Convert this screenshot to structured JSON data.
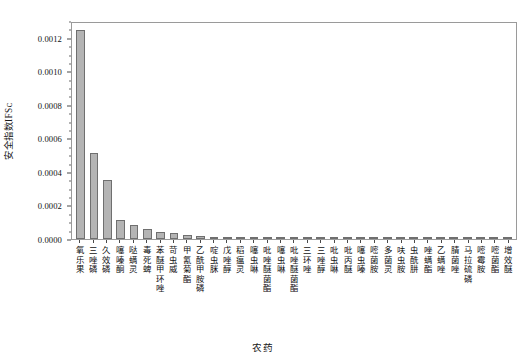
{
  "chart_data": {
    "type": "bar",
    "title": "",
    "xlabel": "农药",
    "ylabel": "安全指数IFSᴄ",
    "ylim": [
      0.0,
      0.0013
    ],
    "grid": false,
    "legend": null,
    "ytick_labels": [
      "0.0000",
      "0.0002",
      "0.0004",
      "0.0006",
      "0.0008",
      "0.0010",
      "0.0012"
    ],
    "ytick_values": [
      0.0,
      0.0002,
      0.0004,
      0.0006,
      0.0008,
      0.001,
      0.0012
    ],
    "yminor_step": 5e-05,
    "bar_color": "#b4b4b4",
    "bar_edge_color": "#6f6f6f",
    "categories": [
      "氧乐果",
      "三唑磷",
      "久效磷",
      "噻嗪酮",
      "哒螨灵",
      "毒死蜱",
      "苯醚甲环唑",
      "苛虫威",
      "甲氰菊酯",
      "乙酰甲胺磷",
      "啶虫脒",
      "戊唑醇",
      "稻瘟灵",
      "噻虫啉",
      "吡唑醚菌酯",
      "噻虫啉",
      "吡唑醚菌酯",
      "三环唑",
      "三唑醇",
      "吡虫啉",
      "吡丙醚",
      "噻虫嗪",
      "嘧菌胺",
      "多菌灵",
      "呋虫胺",
      "虫酰肼",
      "唑螨酯",
      "乙螨唑",
      "腈菌唑",
      "马拉硫磷",
      "嘧霉胺",
      "嘧菌酯",
      "增效醚"
    ],
    "values": [
      0.001245,
      0.00051,
      0.000352,
      0.000113,
      8.2e-05,
      6.2e-05,
      4.3e-05,
      3.6e-05,
      2.2e-05,
      1.8e-05,
      1.4e-05,
      1.1e-05,
      9e-06,
      8e-06,
      7e-06,
      6.2e-06,
      5.5e-06,
      4.8e-06,
      4.2e-06,
      3.7e-06,
      3.2e-06,
      2.8e-06,
      2.5e-06,
      2.1e-06,
      1.8e-06,
      1.6e-06,
      1.3e-06,
      1.1e-06,
      9e-07,
      7e-07,
      5e-07,
      3e-07,
      2e-07
    ]
  }
}
